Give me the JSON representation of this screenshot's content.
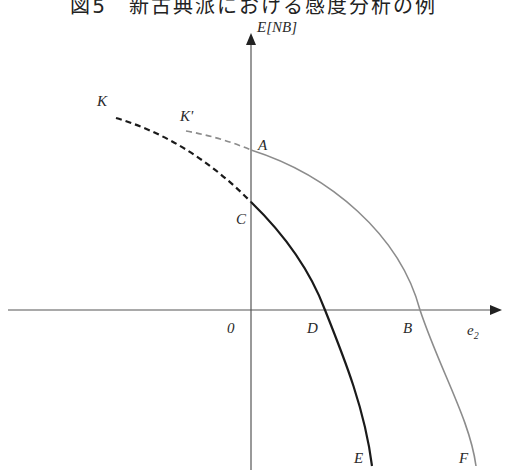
{
  "title": "図5　新古典派における感度分析の例",
  "axes": {
    "y_label": "E[NB]",
    "x_label": "e",
    "x_label_sub": "2",
    "origin_label": "0"
  },
  "points": {
    "A": "A",
    "B": "B",
    "C": "C",
    "D": "D",
    "E": "E",
    "F": "F",
    "K": "K",
    "K_prime": "K'"
  },
  "curves": [
    {
      "name": "K-C-D-E",
      "style": "black solid with dashed extension",
      "color": "#1a1a1a"
    },
    {
      "name": "K'-A-B-F",
      "style": "gray solid with dashed extension",
      "color": "#8a8a8a"
    }
  ],
  "colors": {
    "axis": "#555555",
    "black_curve": "#1a1a1a",
    "gray_curve": "#8c8c8c"
  }
}
